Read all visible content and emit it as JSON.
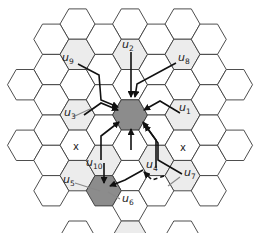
{
  "diagram": {
    "title": "",
    "geometry": {
      "origin": [
        130,
        115
      ],
      "radius": 17.5,
      "dx": 26.25,
      "dy": 30.3
    },
    "colors": {
      "stroke": "#3a3a3a",
      "empty": "#ffffff",
      "light": "#ececec",
      "dark": "#8c8c8c",
      "arrow": "#111111",
      "pointer": "#888888"
    },
    "cells": [
      {
        "q": -2,
        "r": -2,
        "fill": "empty"
      },
      {
        "q": 0,
        "r": -3,
        "fill": "empty"
      },
      {
        "q": 2,
        "r": -4,
        "fill": "empty"
      },
      {
        "q": -3,
        "r": -1,
        "fill": "empty"
      },
      {
        "q": -2,
        "r": -1,
        "fill": "light"
      },
      {
        "q": -1,
        "r": -2,
        "fill": "empty"
      },
      {
        "q": 0,
        "r": -2,
        "fill": "light"
      },
      {
        "q": 1,
        "r": -3,
        "fill": "empty"
      },
      {
        "q": 2,
        "r": -3,
        "fill": "light"
      },
      {
        "q": 3,
        "r": -4,
        "fill": "empty"
      },
      {
        "q": -3,
        "r": 0,
        "fill": "empty"
      },
      {
        "q": -2,
        "r": 0,
        "fill": "empty"
      },
      {
        "q": -1,
        "r": -1,
        "fill": "empty"
      },
      {
        "q": 0,
        "r": -1,
        "fill": "empty"
      },
      {
        "q": 1,
        "r": -2,
        "fill": "empty"
      },
      {
        "q": 2,
        "r": -2,
        "fill": "empty"
      },
      {
        "q": 3,
        "r": -3,
        "fill": "empty"
      },
      {
        "q": -4,
        "r": 1,
        "fill": "empty"
      },
      {
        "q": -3,
        "r": 1,
        "fill": "empty"
      },
      {
        "q": -2,
        "r": 1,
        "fill": "light"
      },
      {
        "q": -1,
        "r": 0,
        "fill": "empty"
      },
      {
        "q": 0,
        "r": 0,
        "fill": "dark"
      },
      {
        "q": 1,
        "r": -1,
        "fill": "empty"
      },
      {
        "q": 2,
        "r": -1,
        "fill": "light"
      },
      {
        "q": 3,
        "r": -2,
        "fill": "empty"
      },
      {
        "q": 4,
        "r": -3,
        "fill": "empty"
      },
      {
        "q": -3,
        "r": 2,
        "fill": "empty"
      },
      {
        "q": -2,
        "r": 2,
        "fill": "empty"
      },
      {
        "q": -1,
        "r": 1,
        "fill": "empty"
      },
      {
        "q": 0,
        "r": 1,
        "fill": "empty"
      },
      {
        "q": 1,
        "r": 0,
        "fill": "empty"
      },
      {
        "q": 2,
        "r": 0,
        "fill": "empty"
      },
      {
        "q": 3,
        "r": -1,
        "fill": "empty"
      },
      {
        "q": -4,
        "r": 3,
        "fill": "empty"
      },
      {
        "q": -3,
        "r": 3,
        "fill": "empty"
      },
      {
        "q": -2,
        "r": 3,
        "fill": "light"
      },
      {
        "q": -1,
        "r": 2,
        "fill": "light"
      },
      {
        "q": 0,
        "r": 2,
        "fill": "empty"
      },
      {
        "q": 1,
        "r": 1,
        "fill": "light"
      },
      {
        "q": 2,
        "r": 1,
        "fill": "light"
      },
      {
        "q": 3,
        "r": 0,
        "fill": "empty"
      },
      {
        "q": 4,
        "r": -1,
        "fill": "empty"
      },
      {
        "q": -3,
        "r": 4,
        "fill": "empty"
      },
      {
        "q": -1,
        "r": 3,
        "fill": "dark"
      },
      {
        "q": 0,
        "r": 3,
        "fill": "empty"
      },
      {
        "q": 1,
        "r": 2,
        "fill": "empty"
      },
      {
        "q": 3,
        "r": 1,
        "fill": "empty"
      },
      {
        "q": -2,
        "r": 5,
        "fill": "empty"
      },
      {
        "q": 0,
        "r": 4,
        "fill": "light"
      },
      {
        "q": 2,
        "r": 3,
        "fill": "empty"
      }
    ],
    "labels": [
      {
        "text": "u",
        "sub": "1",
        "x": 179,
        "y": 111
      },
      {
        "text": "u",
        "sub": "2",
        "x": 122,
        "y": 48
      },
      {
        "text": "u",
        "sub": "3",
        "x": 64,
        "y": 116
      },
      {
        "text": "u",
        "sub": "4",
        "x": 146,
        "y": 168
      },
      {
        "text": "u",
        "sub": "5",
        "x": 63,
        "y": 183
      },
      {
        "text": "u",
        "sub": "6",
        "x": 122,
        "y": 202
      },
      {
        "text": "u",
        "sub": "7",
        "x": 184,
        "y": 176
      },
      {
        "text": "u",
        "sub": "8",
        "x": 178,
        "y": 61
      },
      {
        "text": "u",
        "sub": "9",
        "x": 62,
        "y": 61
      },
      {
        "text": "u",
        "sub": "10",
        "x": 86,
        "y": 166
      }
    ],
    "marks": [
      {
        "text": "x",
        "x": 73,
        "y": 150
      },
      {
        "text": "x",
        "x": 180,
        "y": 151
      }
    ],
    "arrows": [
      {
        "id": "u2",
        "pts": [
          [
            131,
            52
          ],
          [
            131,
            97
          ]
        ],
        "dash": false
      },
      {
        "id": "u8",
        "pts": [
          [
            176,
            63
          ],
          [
            137,
            84
          ],
          [
            135,
            97
          ]
        ],
        "dash": false
      },
      {
        "id": "u9",
        "pts": [
          [
            78,
            64
          ],
          [
            99,
            75
          ],
          [
            101,
            100
          ],
          [
            118,
            107
          ]
        ],
        "dash": false
      },
      {
        "id": "u3",
        "pts": [
          [
            84,
            115
          ],
          [
            101,
            103
          ],
          [
            118,
            110
          ]
        ],
        "dash": false
      },
      {
        "id": "u1",
        "pts": [
          [
            180,
            113
          ],
          [
            160,
            101
          ],
          [
            144,
            110
          ]
        ],
        "dash": false
      },
      {
        "id": "c1",
        "pts": [
          [
            131,
            150
          ],
          [
            131,
            129
          ]
        ],
        "dash": false
      },
      {
        "id": "c2",
        "pts": [
          [
            101,
            160
          ],
          [
            101,
            136
          ],
          [
            119,
            122
          ]
        ],
        "dash": false
      },
      {
        "id": "c3",
        "pts": [
          [
            156,
            168
          ],
          [
            156,
            140
          ],
          [
            143,
            122
          ]
        ],
        "dash": false
      },
      {
        "id": "u10",
        "pts": [
          [
            104,
            163
          ],
          [
            104,
            183
          ]
        ],
        "dash": false
      },
      {
        "id": "u4",
        "pts": [
          [
            143,
            170
          ],
          [
            125,
            180
          ],
          [
            110,
            186
          ]
        ],
        "dash": false
      },
      {
        "id": "u7",
        "pts": [
          [
            182,
            174
          ],
          [
            158,
            160
          ],
          [
            158,
            143
          ],
          [
            145,
            125
          ]
        ],
        "dash": false
      },
      {
        "id": "u7b",
        "pts": [
          [
            164,
            176
          ],
          [
            152,
            180
          ],
          [
            144,
            172
          ]
        ],
        "dash": true
      }
    ],
    "pointers": [
      {
        "for": "u5",
        "x1": 75,
        "y1": 183,
        "x2": 100,
        "y2": 191
      },
      {
        "for": "u6",
        "x1": 120,
        "y1": 199,
        "x2": 108,
        "y2": 192
      },
      {
        "for": "u3",
        "x1": 75,
        "y1": 116,
        "x2": 90,
        "y2": 109
      },
      {
        "for": "u7",
        "x1": 180,
        "y1": 177,
        "x2": 168,
        "y2": 186
      }
    ]
  }
}
